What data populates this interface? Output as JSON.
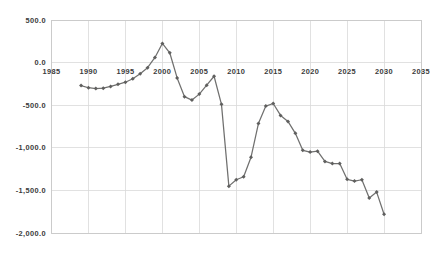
{
  "chart_data": {
    "type": "line",
    "title": "",
    "subtitle": "",
    "xlabel": "",
    "ylabel": "",
    "xlim": [
      1985,
      2035
    ],
    "ylim": [
      -2000,
      500
    ],
    "grid": true,
    "legend": false,
    "legend_position": "none",
    "x_tick_labels": [
      "1985",
      "1990",
      "1995",
      "2000",
      "2005",
      "2010",
      "2015",
      "2020",
      "2025",
      "2030",
      "2035"
    ],
    "x_tick_values": [
      1985,
      1990,
      1995,
      2000,
      2005,
      2010,
      2015,
      2020,
      2025,
      2030,
      2035
    ],
    "y_tick_labels": [
      "500.0",
      "0.0",
      "-500.0",
      "-1,000.0",
      "-1,500.0",
      "-2,000.0"
    ],
    "y_tick_values": [
      500,
      0,
      -500,
      -1000,
      -1500,
      -2000
    ],
    "marker": "diamond",
    "line_color": "#70706f",
    "marker_color": "#5f5f5e",
    "grid_color": "#d9d9d9",
    "background_color": "#ffffff",
    "x": [
      1989,
      1990,
      1991,
      1992,
      1993,
      1994,
      1995,
      1996,
      1997,
      1998,
      1999,
      2000,
      2001,
      2002,
      2003,
      2004,
      2005,
      2006,
      2007,
      2008,
      2009,
      2010,
      2011,
      2012,
      2013,
      2014,
      2015,
      2016,
      2017,
      2018,
      2019,
      2020,
      2021,
      2022,
      2023,
      2024,
      2025,
      2026,
      2027,
      2028,
      2029,
      2030
    ],
    "series": [
      {
        "name": "Deficit",
        "values": [
          -270,
          -295,
          -305,
          -300,
          -280,
          -255,
          -230,
          -190,
          -130,
          -60,
          60,
          225,
          115,
          -180,
          -400,
          -440,
          -370,
          -265,
          -160,
          -490,
          -1450,
          -1375,
          -1340,
          -1110,
          -715,
          -510,
          -480,
          -620,
          -690,
          -830,
          -1030,
          -1050,
          -1040,
          -1160,
          -1185,
          -1185,
          -1370,
          -1390,
          -1375,
          -1590,
          -1520,
          -1780
        ]
      }
    ]
  },
  "axis": {
    "x_axis_label_row_position": "at-zero-line"
  }
}
